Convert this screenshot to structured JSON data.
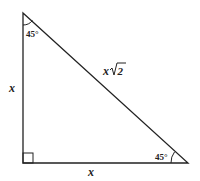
{
  "diagram": {
    "vertices": {
      "top": [
        23,
        13
      ],
      "right_angle": [
        23,
        163
      ],
      "bottom_right": [
        188,
        163
      ]
    },
    "labels": {
      "left_leg": "x",
      "bottom_leg": "x",
      "hypotenuse_var": "x",
      "hypotenuse_root": "2",
      "top_angle": "45°",
      "bottom_right_angle": "45°"
    },
    "colors": {
      "stroke": "#222222",
      "background": "#ffffff"
    }
  }
}
